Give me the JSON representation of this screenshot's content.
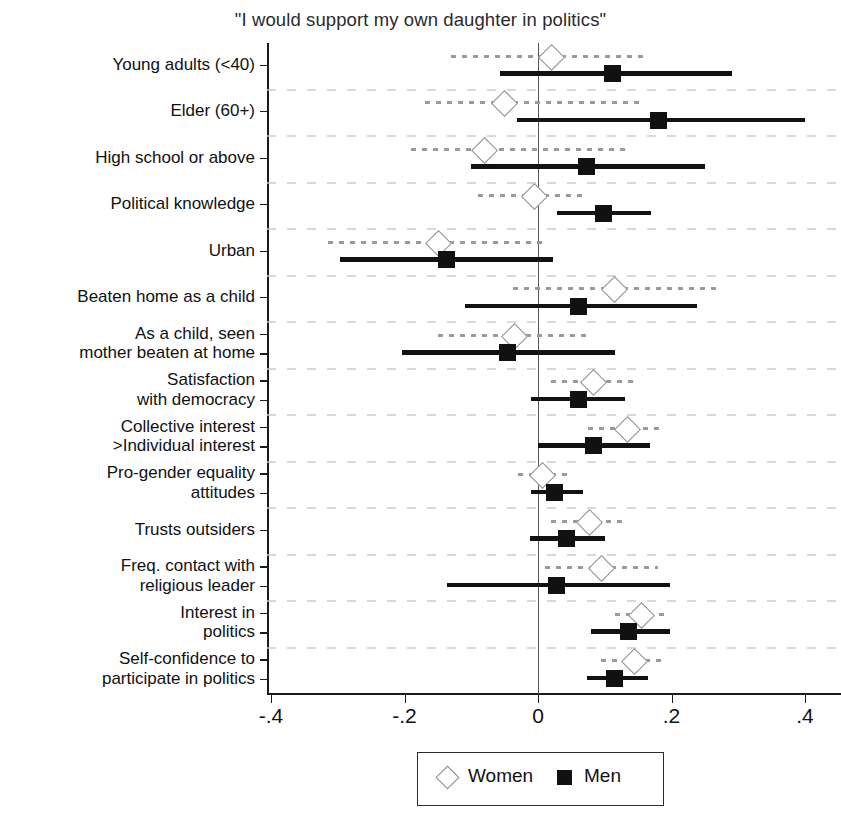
{
  "chart_data": {
    "type": "scatter",
    "title": "\"I would support my own daughter in politics\"",
    "xlabel": "",
    "ylabel": "",
    "xlim": [
      -0.5,
      0.5
    ],
    "xticks": [
      -0.4,
      -0.2,
      0,
      0.2,
      0.4
    ],
    "xticklabels": [
      "-.4",
      "-.2",
      "0",
      ".2",
      ".4"
    ],
    "grid": true,
    "grid_style": "dotted horizontal bands",
    "zero_reference_line": 0,
    "legend_position": "bottom-center",
    "categories": [
      "Young adults (<40)",
      "Elder (60+)",
      "High school or above",
      "Political knowledge",
      "Urban",
      "Beaten home as a child",
      "As a child, seen\nmother beaten at home",
      "Satisfaction\nwith democracy",
      "Collective interest\n>Individual interest",
      "Pro-gender equality\nattitudes",
      "Trusts outsiders",
      "Freq. contact with\nreligious leader",
      "Interest in\npolitics",
      "Self-confidence to\nparticipate in politics"
    ],
    "series": [
      {
        "name": "Women",
        "marker": "open-diamond",
        "color": "#8c8c8c",
        "values": [
          0.018,
          -0.052,
          -0.082,
          -0.006,
          -0.151,
          0.113,
          -0.037,
          0.081,
          0.133,
          0.005,
          0.075,
          0.093,
          0.153,
          0.143
        ],
        "ci_low": [
          -0.13,
          -0.17,
          -0.19,
          -0.09,
          -0.315,
          -0.037,
          -0.15,
          0.02,
          0.075,
          -0.03,
          0.02,
          0.01,
          0.115,
          0.095
        ],
        "ci_high": [
          0.16,
          0.16,
          0.13,
          0.073,
          0.015,
          0.268,
          0.08,
          0.145,
          0.19,
          0.045,
          0.13,
          0.18,
          0.195,
          0.19
        ]
      },
      {
        "name": "Men",
        "marker": "filled-square",
        "color": "#111111",
        "values": [
          0.112,
          0.181,
          0.073,
          0.098,
          -0.137,
          0.06,
          -0.045,
          0.06,
          0.083,
          0.025,
          0.043,
          0.028,
          0.135,
          0.115
        ],
        "ci_low": [
          -0.057,
          -0.032,
          -0.1,
          0.028,
          -0.297,
          -0.11,
          -0.204,
          -0.01,
          0.0,
          -0.01,
          -0.012,
          -0.137,
          0.08,
          0.073
        ],
        "ci_high": [
          0.29,
          0.4,
          0.25,
          0.17,
          0.022,
          0.238,
          0.115,
          0.13,
          0.168,
          0.068,
          0.1,
          0.198,
          0.198,
          0.165
        ]
      }
    ]
  },
  "legend": {
    "items": [
      {
        "label": "Women",
        "marker": "open-diamond"
      },
      {
        "label": "Men",
        "marker": "filled-square"
      }
    ]
  },
  "colors": {
    "women": "#8c8c8c",
    "men": "#111111",
    "axis": "#1a1a1a",
    "grid": "#c9c9c9",
    "background": "#ffffff"
  }
}
